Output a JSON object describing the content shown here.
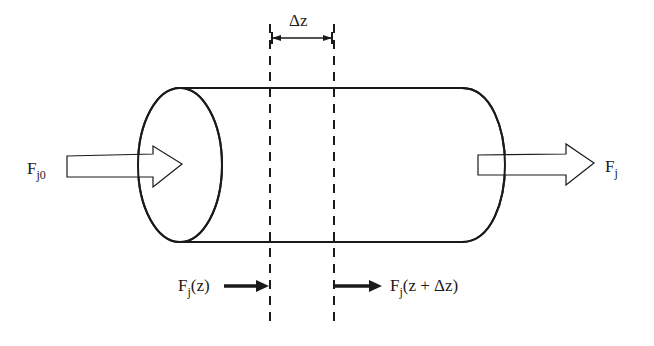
{
  "diagram": {
    "labels": {
      "delta_z": "Δz",
      "inlet_main": "F",
      "inlet_sub": "j0",
      "outlet_main": "F",
      "outlet_sub": "j",
      "fz_main": "F",
      "fz_sub": "j",
      "fz_arg": "(z)",
      "fzdz_main": "F",
      "fzdz_sub": "j",
      "fzdz_arg": "(z + Δz)"
    },
    "colors": {
      "stroke": "#1a1a1a",
      "background": "#ffffff"
    }
  }
}
